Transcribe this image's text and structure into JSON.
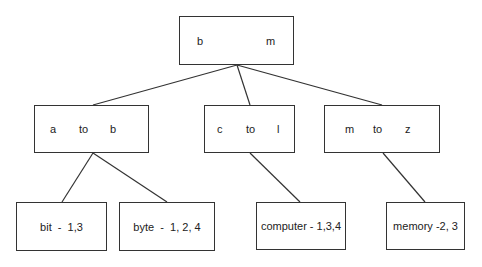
{
  "diagram": {
    "type": "tree",
    "root": {
      "id": "root",
      "parts": [
        "b",
        "m"
      ]
    },
    "level1": [
      {
        "id": "n-a-b",
        "parts": [
          "a",
          "to",
          "b"
        ]
      },
      {
        "id": "n-c-l",
        "parts": [
          "c",
          "to",
          "l"
        ]
      },
      {
        "id": "n-m-z",
        "parts": [
          "m",
          "to",
          "z"
        ]
      }
    ],
    "leaves": [
      {
        "id": "leaf-bit",
        "label": "bit  -  1,3",
        "parent": "n-a-b"
      },
      {
        "id": "leaf-byte",
        "label": "byte  -  1, 2, 4",
        "parent": "n-a-b"
      },
      {
        "id": "leaf-computer",
        "label": "computer - 1,3,4",
        "parent": "n-c-l"
      },
      {
        "id": "leaf-memory",
        "label": "memory -2, 3",
        "parent": "n-m-z"
      }
    ],
    "edges": [
      [
        "root",
        "n-a-b"
      ],
      [
        "root",
        "n-c-l"
      ],
      [
        "root",
        "n-m-z"
      ],
      [
        "n-a-b",
        "leaf-bit"
      ],
      [
        "n-a-b",
        "leaf-byte"
      ],
      [
        "n-c-l",
        "leaf-computer"
      ],
      [
        "n-m-z",
        "leaf-memory"
      ]
    ],
    "line_color": "#333333"
  }
}
